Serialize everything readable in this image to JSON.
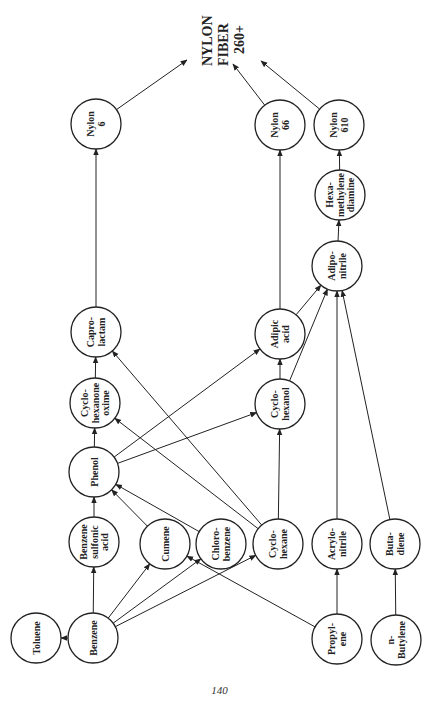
{
  "title": {
    "lines": [
      "NYLON",
      "FIBER",
      "260+"
    ]
  },
  "page_number": "140",
  "nodes": [
    {
      "id": "nylon6",
      "lines": [
        "Nylon",
        "6"
      ],
      "x": 96,
      "y": 124
    },
    {
      "id": "nylon66",
      "lines": [
        "Nylon",
        "66"
      ],
      "x": 280,
      "y": 125
    },
    {
      "id": "nylon610",
      "lines": [
        "Nylon",
        "610"
      ],
      "x": 339,
      "y": 125
    },
    {
      "id": "hexamethylenediamine",
      "lines": [
        "Hexa-",
        "methylene",
        "diamine"
      ],
      "x": 340,
      "y": 195
    },
    {
      "id": "adiponitrile",
      "lines": [
        "Adipo-",
        "nitrile"
      ],
      "x": 337,
      "y": 266
    },
    {
      "id": "caprolactam",
      "lines": [
        "Capro-",
        "lactam"
      ],
      "x": 96,
      "y": 332
    },
    {
      "id": "adipicacid",
      "lines": [
        "Adipic",
        "acid"
      ],
      "x": 280,
      "y": 334
    },
    {
      "id": "cyclohexanoneoxime",
      "lines": [
        "Cyclo-",
        "hexanone",
        "oxime"
      ],
      "x": 95,
      "y": 403
    },
    {
      "id": "cyclohexanol",
      "lines": [
        "Cyclo-",
        "hexanol"
      ],
      "x": 280,
      "y": 404
    },
    {
      "id": "phenol",
      "lines": [
        "Phenol"
      ],
      "x": 94,
      "y": 472
    },
    {
      "id": "benzenesulfonicacid",
      "lines": [
        "Benzene",
        "sulfonic",
        "acid"
      ],
      "x": 94,
      "y": 542
    },
    {
      "id": "cumene",
      "lines": [
        "Cumene"
      ],
      "x": 165,
      "y": 544
    },
    {
      "id": "chlorobenzene",
      "lines": [
        "Chloro-",
        "benzene"
      ],
      "x": 221,
      "y": 544
    },
    {
      "id": "cyclohexane",
      "lines": [
        "Cyclo-",
        "hexane"
      ],
      "x": 278,
      "y": 544
    },
    {
      "id": "acrylonitrile",
      "lines": [
        "Acrylo-",
        "nitrile"
      ],
      "x": 337,
      "y": 544
    },
    {
      "id": "butadiene",
      "lines": [
        "Buta-",
        "diene"
      ],
      "x": 395,
      "y": 544
    },
    {
      "id": "toluene",
      "lines": [
        "Toluene"
      ],
      "x": 36,
      "y": 638
    },
    {
      "id": "benzene",
      "lines": [
        "Benzene"
      ],
      "x": 93,
      "y": 638
    },
    {
      "id": "propylene",
      "lines": [
        "Propyl-",
        "ene"
      ],
      "x": 337,
      "y": 639
    },
    {
      "id": "nbutylene",
      "lines": [
        "n-",
        "Butylene"
      ],
      "x": 396,
      "y": 640
    }
  ],
  "edges": [
    {
      "from": "benzene",
      "to": "toluene"
    },
    {
      "from": "benzene",
      "to": "benzenesulfonicacid"
    },
    {
      "from": "benzene",
      "to": "cumene"
    },
    {
      "from": "benzene",
      "to": "chlorobenzene"
    },
    {
      "from": "benzene",
      "to": "cyclohexane"
    },
    {
      "from": "propylene",
      "to": "cumene"
    },
    {
      "from": "propylene",
      "to": "acrylonitrile"
    },
    {
      "from": "nbutylene",
      "to": "butadiene"
    },
    {
      "from": "benzenesulfonicacid",
      "to": "phenol"
    },
    {
      "from": "cumene",
      "to": "phenol"
    },
    {
      "from": "chlorobenzene",
      "to": "phenol"
    },
    {
      "from": "cyclohexane",
      "to": "cyclohexanoneoxime"
    },
    {
      "from": "cyclohexane",
      "to": "caprolactam"
    },
    {
      "from": "cyclohexane",
      "to": "cyclohexanol"
    },
    {
      "from": "phenol",
      "to": "cyclohexanoneoxime"
    },
    {
      "from": "phenol",
      "to": "adipicacid"
    },
    {
      "from": "phenol",
      "to": "cyclohexanol"
    },
    {
      "from": "cyclohexanoneoxime",
      "to": "caprolactam"
    },
    {
      "from": "cyclohexanol",
      "to": "adipicacid"
    },
    {
      "from": "cyclohexanol",
      "to": "adiponitrile"
    },
    {
      "from": "adipicacid",
      "to": "adiponitrile"
    },
    {
      "from": "acrylonitrile",
      "to": "adiponitrile"
    },
    {
      "from": "butadiene",
      "to": "adiponitrile"
    },
    {
      "from": "adiponitrile",
      "to": "hexamethylenediamine"
    },
    {
      "from": "caprolactam",
      "to": "nylon6"
    },
    {
      "from": "adipicacid",
      "to": "nylon66"
    },
    {
      "from": "hexamethylenediamine",
      "to": "nylon610"
    },
    {
      "from": "nylon6",
      "to": "fiber",
      "tx": 187,
      "ty": 60
    },
    {
      "from": "nylon66",
      "to": "fiber",
      "tx": 233,
      "ty": 64
    },
    {
      "from": "nylon610",
      "to": "fiber",
      "tx": 261,
      "ty": 61
    }
  ],
  "node_radius": 25,
  "colors": {
    "stroke": "#222222",
    "fill": "#ffffff",
    "text": "#222222"
  }
}
